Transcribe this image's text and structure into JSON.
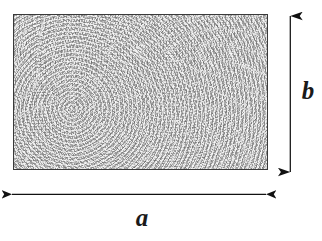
{
  "figure": {
    "type": "geometry-diagram",
    "background_color": "#ffffff",
    "shape": {
      "name": "rectangle",
      "fill_style": "stippled-gray-texture",
      "fill_color": "#dedede",
      "stroke_color": "#3a3a3a",
      "x": 13,
      "y": 14,
      "width": 255,
      "height": 156
    },
    "dimensions": [
      {
        "id": "width-dimension",
        "label": "a",
        "orientation": "horizontal",
        "arrow_style": "double-headed",
        "line_color": "#111111",
        "x1": 12,
        "y1": 194,
        "x2": 266,
        "y2": 194,
        "label_x": 141,
        "label_y": 219
      },
      {
        "id": "height-dimension",
        "label": "b",
        "orientation": "vertical",
        "arrow_style": "double-headed",
        "line_color": "#111111",
        "x1": 290,
        "y1": 16,
        "x2": 290,
        "y2": 172,
        "label_x": 308,
        "label_y": 94
      }
    ]
  }
}
